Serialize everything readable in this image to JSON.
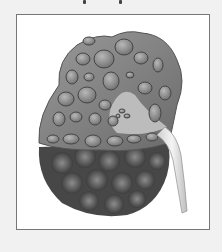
{
  "image": {
    "subject": "polycystic kidney cross-section illustration",
    "alt": "Illustration of a polycystic kidney showing many fluid-filled cysts, cut-away view with ureter",
    "colors": {
      "background": "#f1f1f1",
      "frame_border": "#777777",
      "frame_fill": "#ffffff",
      "kidney_tissue": "#8a8a8a",
      "cyst_fill": "#9c9c9c",
      "outer_surface": "#4a4a4a",
      "ureter": "#e6e6e6"
    }
  }
}
